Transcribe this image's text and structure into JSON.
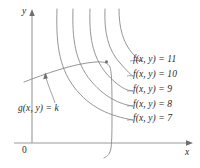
{
  "figure": {
    "type": "math-diagram",
    "background": "#ffffff",
    "curve_color": "#8a8a8a",
    "axis_color": "#9a9a9a",
    "text_color": "#2b2b2b"
  },
  "axes": {
    "y_label": "y",
    "x_label": "x",
    "origin_label": "0"
  },
  "level_curves": [
    {
      "label_prefix": "f(x, y)",
      "equals": "=",
      "value": "11",
      "label": "f(x, y) = 11"
    },
    {
      "label_prefix": "f(x, y)",
      "equals": "=",
      "value": "10",
      "label": "f(x, y) = 10"
    },
    {
      "label_prefix": "f(x, y)",
      "equals": "=",
      "value": "9",
      "label": "f(x, y) = 9"
    },
    {
      "label_prefix": "f(x, y)",
      "equals": "=",
      "value": "8",
      "label": "f(x, y) = 8"
    },
    {
      "label_prefix": "f(x, y)",
      "equals": "=",
      "value": "7",
      "label": "f(x, y) = 7"
    }
  ],
  "constraint": {
    "label_prefix": "g(x, y)",
    "equals": "=",
    "value": "k",
    "label": "g(x, y) = k"
  }
}
